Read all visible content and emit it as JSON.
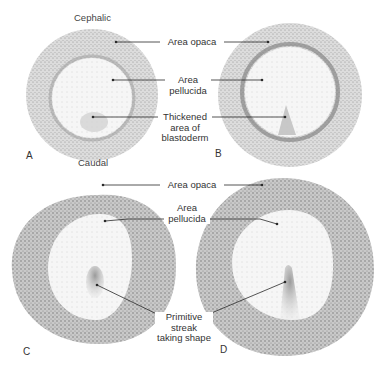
{
  "orientation": {
    "top": "Cephalic",
    "bottom": "Caudal"
  },
  "panels": [
    {
      "letter": "A",
      "stage": "early blastoderm"
    },
    {
      "letter": "B",
      "stage": "thickened blastoderm"
    },
    {
      "letter": "C",
      "stage": "primitive streak forming"
    },
    {
      "letter": "D",
      "stage": "primitive streak elongating"
    }
  ],
  "labels": {
    "area_opaca_top": "Area opaca",
    "area_pellucida_top_1": "Area",
    "area_pellucida_top_2": "pellucida",
    "thickened_1": "Thickened",
    "thickened_2": "area of",
    "thickened_3": "blastoderm",
    "area_opaca_bottom": "Area opaca",
    "area_pellucida_bottom_1": "Area",
    "area_pellucida_bottom_2": "pellucida",
    "primitive_1": "Primitive",
    "primitive_2": "streak",
    "primitive_3": "taking shape"
  },
  "colors": {
    "ink": "#2a2a2a",
    "stipple_dark": "#8a8a8a",
    "stipple_light": "#d4d4d4",
    "background": "#ffffff"
  }
}
